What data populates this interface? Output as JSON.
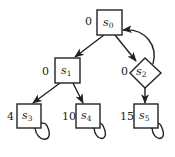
{
  "diagram": {
    "type": "game-graph",
    "nodes": [
      {
        "id": "s0",
        "label": "s",
        "sub": "0",
        "value": "0",
        "shape": "square"
      },
      {
        "id": "s1",
        "label": "s",
        "sub": "1",
        "value": "0",
        "shape": "square"
      },
      {
        "id": "s2",
        "label": "s",
        "sub": "2",
        "value": "0",
        "shape": "diamond"
      },
      {
        "id": "s3",
        "label": "s",
        "sub": "3",
        "value": "4",
        "shape": "square"
      },
      {
        "id": "s4",
        "label": "s",
        "sub": "4",
        "value": "10",
        "shape": "square"
      },
      {
        "id": "s5",
        "label": "s",
        "sub": "5",
        "value": "15",
        "shape": "square"
      }
    ],
    "edges": [
      {
        "from": "s0",
        "to": "s1"
      },
      {
        "from": "s0",
        "to": "s2"
      },
      {
        "from": "s2",
        "to": "s0"
      },
      {
        "from": "s1",
        "to": "s3"
      },
      {
        "from": "s1",
        "to": "s4"
      },
      {
        "from": "s2",
        "to": "s5"
      },
      {
        "from": "s3",
        "to": "s3"
      },
      {
        "from": "s4",
        "to": "s4"
      },
      {
        "from": "s5",
        "to": "s5"
      }
    ]
  }
}
